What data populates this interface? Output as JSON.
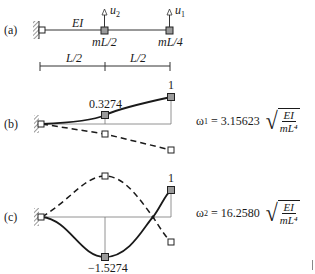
{
  "panel_a": {
    "label": "(a)",
    "beam_label": "EI",
    "mass1_label": "mL/2",
    "mass2_label": "mL/4",
    "dof2_label": "u",
    "dof2_sub": "2",
    "dof1_label": "u",
    "dof1_sub": "1",
    "span1": "L/2",
    "span2": "L/2"
  },
  "panel_b": {
    "label": "(b)",
    "mid_value": "0.3274",
    "end_value": "1",
    "omega_symbol": "ω",
    "omega_sub": "1",
    "omega_eq": " = 3.15623",
    "sqrt_num": "EI",
    "sqrt_den": "mL⁴"
  },
  "panel_c": {
    "label": "(c)",
    "mid_value": "−1.5274",
    "end_value": "1",
    "omega_symbol": "ω",
    "omega_sub": "2",
    "omega_eq": " = 16.2580",
    "sqrt_num": "EI",
    "sqrt_den": "mL⁴"
  },
  "modes": [
    {
      "name": "mode 1",
      "frequency_coefficient": 3.15623,
      "shape": [
        0.3274,
        1
      ]
    },
    {
      "name": "mode 2",
      "frequency_coefficient": 16.258,
      "shape": [
        -1.5274,
        1
      ]
    }
  ],
  "colors": {
    "line": "#1a1a1a",
    "node_fill": "#9a9a9a",
    "thin": "#555555"
  }
}
